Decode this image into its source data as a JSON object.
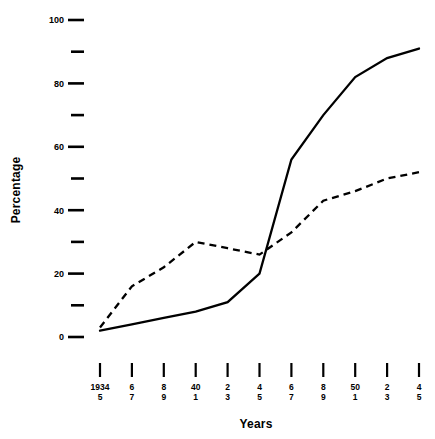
{
  "chart_data": {
    "type": "line",
    "title": "",
    "xlabel": "Years",
    "ylabel": "Percentage",
    "ylim": [
      0,
      100
    ],
    "yticks": [
      0,
      10,
      20,
      30,
      40,
      50,
      60,
      70,
      80,
      90,
      100
    ],
    "ytick_labels": [
      "0",
      "",
      "20",
      "",
      "40",
      "",
      "60",
      "",
      "80",
      "",
      "100"
    ],
    "grid": false,
    "legend": "none",
    "x": [
      "1934-5",
      "6-7",
      "8-9",
      "40-1",
      "2-3",
      "4-5",
      "6-7",
      "8-9",
      "50-1",
      "2-3",
      "4-5"
    ],
    "xtick_top": [
      "1934",
      "6",
      "8",
      "40",
      "2",
      "4",
      "6",
      "8",
      "50",
      "2",
      "4"
    ],
    "xtick_bottom": [
      "5",
      "7",
      "9",
      "1",
      "3",
      "5",
      "7",
      "9",
      "1",
      "3",
      "5"
    ],
    "series": [
      {
        "name": "solid-line",
        "style": "solid",
        "color": "#000000",
        "values": [
          2,
          4,
          6,
          8,
          11,
          20,
          56,
          70,
          82,
          88,
          91
        ]
      },
      {
        "name": "dashed-line",
        "style": "dashed",
        "color": "#000000",
        "values": [
          3,
          16,
          22,
          30,
          28,
          26,
          33,
          43,
          46,
          50,
          52
        ]
      }
    ]
  },
  "axes": {
    "y_title": "Percentage",
    "x_title": "Years"
  }
}
